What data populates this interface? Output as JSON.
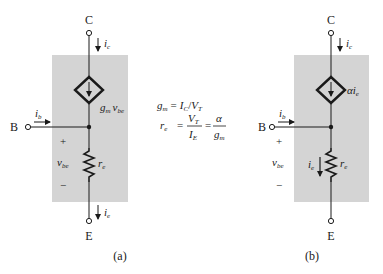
{
  "colors": {
    "shade": "#d4d4d4",
    "wire": "#1a1a1a",
    "background": "#ffffff"
  },
  "circuit_a": {
    "caption": "(a)",
    "terminal_c": "C",
    "terminal_b": "B",
    "terminal_e": "E",
    "current_collector": {
      "base": "i",
      "sub": "c"
    },
    "current_base": {
      "base": "i",
      "sub": "b"
    },
    "current_emitter": {
      "base": "i",
      "sub": "e"
    },
    "source_label": {
      "g": "g",
      "g_sub": "m",
      "v": "v",
      "v_sub": "be"
    },
    "vbe": {
      "base": "v",
      "sub": "be"
    },
    "plus": "+",
    "minus": "−",
    "resistor": {
      "base": "r",
      "sub": "e"
    }
  },
  "equations": {
    "gm": {
      "lhs": "g",
      "lhs_sub": "m",
      "eq": "=",
      "i": "I",
      "i_sub": "C",
      "slash": "/",
      "v": "V",
      "v_sub": "T"
    },
    "re": {
      "lhs": "r",
      "lhs_sub": "e",
      "eq1": "=",
      "num1": "V",
      "num1_sub": "T",
      "den1": "I",
      "den1_sub": "E",
      "eq2": "=",
      "num2": "α",
      "den2": "g",
      "den2_sub": "m"
    }
  },
  "circuit_b": {
    "caption": "(b)",
    "terminal_c": "C",
    "terminal_b": "B",
    "terminal_e": "E",
    "current_collector": {
      "base": "i",
      "sub": "c"
    },
    "current_base": {
      "base": "i",
      "sub": "b"
    },
    "source_label": {
      "alpha": "α",
      "i": "i",
      "i_sub": "e"
    },
    "vbe": {
      "base": "v",
      "sub": "be"
    },
    "plus": "+",
    "minus": "−",
    "resistor": {
      "base": "r",
      "sub": "e"
    },
    "resistor_current": {
      "base": "i",
      "sub": "e"
    }
  }
}
